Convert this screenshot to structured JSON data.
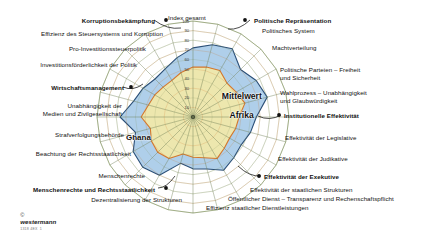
{
  "figure": {
    "top_axis_label": "Index gesamt",
    "center_label_line1": "Mittelwert",
    "center_label_line2": "Afrika",
    "ghana_label": "Ghana",
    "copyright_symbol": "©",
    "copyright_brand": "westermann",
    "copyright_code": "1318 4EX_1"
  },
  "colors": {
    "ghana_fill": "#a8cbe8",
    "ghana_stroke": "#2b4f77",
    "africa_fill": "#f2e9a8",
    "africa_stroke": "#d4772c",
    "grid": "#8a9a6a",
    "spoke": "#6f7f55",
    "axis_text": "#3a3a3a",
    "label_text": "#111111"
  },
  "scale": {
    "max": 100,
    "min": 0,
    "ticks": [
      100,
      90,
      80,
      70,
      60,
      50,
      40,
      30,
      20,
      10
    ]
  },
  "group_labels": [
    {
      "text": "Korruptionsbekämpfung",
      "bold": true
    },
    {
      "text": "Wirtschaftsmanagement",
      "bold": true
    },
    {
      "text": "Menschenrechte und Rechtsstaatlichkeit",
      "bold": true
    },
    {
      "text": "Politische Repräsentation",
      "bold": true
    },
    {
      "text": "Institutionelle Effektivität",
      "bold": true
    },
    {
      "text": "Effektivität der Exekutive",
      "bold": true
    }
  ],
  "chart_data": {
    "type": "radar",
    "title": "Index gesamt",
    "ylabel": "",
    "xlabel": "",
    "ylim": [
      0,
      100
    ],
    "grid": true,
    "legend_position": "inline",
    "tick_labels": [
      "10",
      "20",
      "30",
      "40",
      "50",
      "60",
      "70",
      "80",
      "90",
      "100"
    ],
    "categories": [
      "Index gesamt",
      "Politische Repräsentation",
      "Politisches System",
      "Machtverteilung",
      "Politische Parteien – Freiheit und Sicherheit",
      "Wahlprozess – Unabhängigkeit und Glaubwürdigkeit",
      "Institutionelle Effektivität",
      "Effektivität der Legislative",
      "Effektivität der Judikative",
      "Effektivität der Exekutive",
      "Effektivität der staatlichen Strukturen",
      "Öffentlicher Dienst – Transparenz und Rechenschaftspflicht",
      "Effizienz staatlicher Dienstleistungen",
      "Dezentralisierung der Strukturen",
      "Menschenrechte und Rechtsstaatlichkeit",
      "Menschenrechte",
      "Beachtung der Rechtsstaatlichkeit",
      "Strafverfolgungsbehörde",
      "Unabhängigkeit der Medien und Zivilgesellschaft",
      "Wirtschaftsmanagement",
      "Investitionsförderlichkeit der Politik",
      "Pro-Investitionssteuerpolitik",
      "Effizienz des Steuersystems und Korruption",
      "Korruptionsbekämpfung"
    ],
    "series": [
      {
        "name": "Ghana",
        "color": "#a8cbe8",
        "values": [
          72,
          78,
          82,
          70,
          76,
          80,
          66,
          62,
          58,
          60,
          64,
          56,
          54,
          50,
          70,
          74,
          72,
          62,
          76,
          64,
          60,
          56,
          58,
          64
        ]
      },
      {
        "name": "Mittelwert Afrika",
        "color": "#f2e9a8",
        "values": [
          52,
          54,
          56,
          50,
          52,
          56,
          48,
          46,
          44,
          46,
          50,
          44,
          42,
          40,
          50,
          52,
          50,
          46,
          54,
          48,
          46,
          44,
          44,
          48
        ]
      }
    ]
  },
  "labels": {
    "left": [
      {
        "id": "korruptionsbekaempfung",
        "text": "Korruptionsbekämpfung",
        "bold": true
      },
      {
        "id": "effizienz-steuersystem",
        "text": "Effizienz des Steuersystems und Korruption",
        "bold": false
      },
      {
        "id": "pro-investitionssteuerpolitik",
        "text": "Pro-Investitionssteuerpolitik",
        "bold": false
      },
      {
        "id": "investitionsfoerderlichkeit",
        "text": "Investitionsförderlichkeit der Politik",
        "bold": false
      },
      {
        "id": "wirtschaftsmanagement",
        "text": "Wirtschaftsmanagement",
        "bold": true
      },
      {
        "id": "unabhaengigkeit-medien-1",
        "text": "Unabhängigkeit der",
        "bold": false
      },
      {
        "id": "unabhaengigkeit-medien-2",
        "text": "Medien und Zivilgesellschaft",
        "bold": false
      },
      {
        "id": "strafverfolgungsbehoerde",
        "text": "Strafverfolgungsbehörde",
        "bold": false
      },
      {
        "id": "beachtung-rechtsstaatlichkeit",
        "text": "Beachtung der Rechtsstaatlichkeit",
        "bold": false
      },
      {
        "id": "menschenrechte",
        "text": "Menschenrechte",
        "bold": false
      },
      {
        "id": "menschenrechte-rechtsstaatlichkeit",
        "text": "Menschenrechte und Rechtsstaatlichkeit",
        "bold": true
      },
      {
        "id": "dezentralisierung",
        "text": "Dezentralisierung der Strukturen",
        "bold": false
      }
    ],
    "right": [
      {
        "id": "politische-repraesentation",
        "text": "Politische Repräsentation",
        "bold": true
      },
      {
        "id": "politisches-system",
        "text": "Politisches System",
        "bold": false
      },
      {
        "id": "machtverteilung",
        "text": "Machtverteilung",
        "bold": false
      },
      {
        "id": "politische-parteien-1",
        "text": "Politische Parteien – Freiheit",
        "bold": false
      },
      {
        "id": "politische-parteien-2",
        "text": "und Sicherheit",
        "bold": false
      },
      {
        "id": "wahlprozess-1",
        "text": "Wahlprozess – Unabhängigkeit",
        "bold": false
      },
      {
        "id": "wahlprozess-2",
        "text": "und Glaubwürdigkeit",
        "bold": false
      },
      {
        "id": "institutionelle-effektivitaet",
        "text": "Institutionelle Effektivität",
        "bold": true
      },
      {
        "id": "effektivitaet-legislative",
        "text": "Effektivität der Legislative",
        "bold": false
      },
      {
        "id": "effektivitaet-judikative",
        "text": "Effektivität der Judikative",
        "bold": false
      },
      {
        "id": "effektivitaet-exekutive",
        "text": "Effektivität der Exekutive",
        "bold": true
      },
      {
        "id": "effektivitaet-staatliche-strukturen",
        "text": "Effektivität der staatlichen Strukturen",
        "bold": false
      },
      {
        "id": "oeffentlicher-dienst",
        "text": "Öffentlicher Dienst – Transparenz und Rechenschaftspflicht",
        "bold": false
      },
      {
        "id": "effizienz-dienstleistungen",
        "text": "Effizienz staatlicher Dienstleistungen",
        "bold": false
      }
    ]
  }
}
